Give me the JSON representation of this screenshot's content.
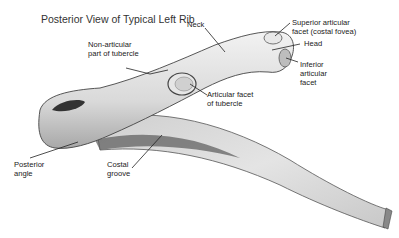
{
  "title": "Posterior View of Typical Left Rib",
  "labels": {
    "neck": "Neck",
    "superior_facet": "Superior articular\nfacet (costal fovea)",
    "head": "Head",
    "inferior_facet": "Inferior\narticular\nfacet",
    "non_articular": "Non-articular\npart of tubercle",
    "articular_tubercle": "Articular facet\nof tubercle",
    "posterior_angle": "Posterior\nangle",
    "costal_groove": "Costal\ngroove"
  }
}
